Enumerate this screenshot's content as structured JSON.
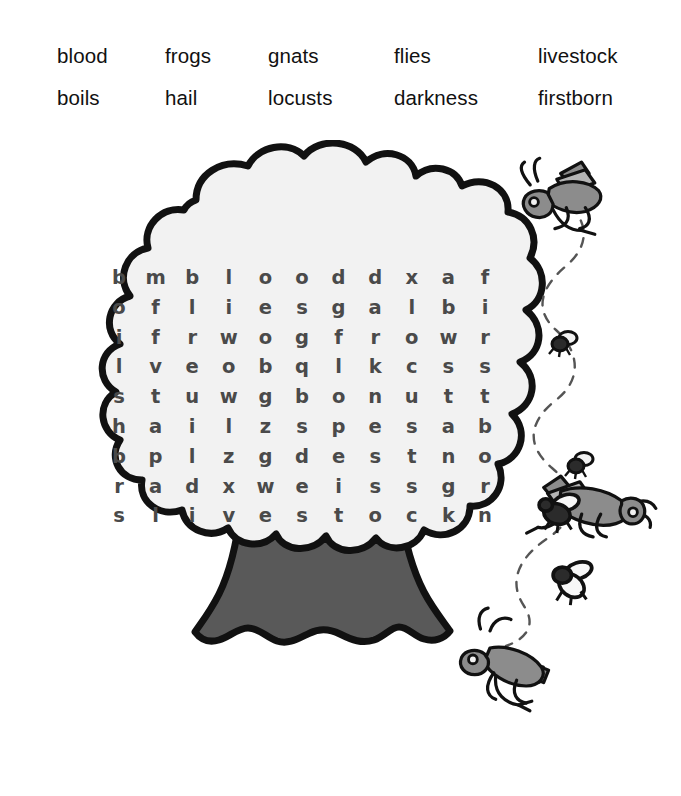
{
  "word_bank": {
    "rows": [
      [
        "blood",
        "frogs",
        "gnats",
        "flies",
        "livestock"
      ],
      [
        "boils",
        "hail",
        "locusts",
        "darkness",
        "firstborn"
      ]
    ]
  },
  "puzzle": {
    "grid": [
      [
        "b",
        "m",
        "b",
        "l",
        "o",
        "o",
        "d",
        "d",
        "x",
        "a",
        "f"
      ],
      [
        "o",
        "f",
        "l",
        "i",
        "e",
        "s",
        "g",
        "a",
        "l",
        "b",
        "i"
      ],
      [
        "i",
        "f",
        "r",
        "w",
        "o",
        "g",
        "f",
        "r",
        "o",
        "w",
        "r"
      ],
      [
        "l",
        "v",
        "e",
        "o",
        "b",
        "q",
        "l",
        "k",
        "c",
        "s",
        "s"
      ],
      [
        "s",
        "t",
        "u",
        "w",
        "g",
        "b",
        "o",
        "n",
        "u",
        "t",
        "t"
      ],
      [
        "h",
        "a",
        "i",
        "l",
        "z",
        "s",
        "p",
        "e",
        "s",
        "a",
        "b"
      ],
      [
        "b",
        "p",
        "l",
        "z",
        "g",
        "d",
        "e",
        "s",
        "t",
        "n",
        "o"
      ],
      [
        "r",
        "a",
        "d",
        "x",
        "w",
        "e",
        "i",
        "s",
        "s",
        "g",
        "r"
      ],
      [
        "s",
        "l",
        "i",
        "v",
        "e",
        "s",
        "t",
        "o",
        "c",
        "k",
        "n"
      ]
    ],
    "rows": 9,
    "columns": 11
  },
  "colors": {
    "outline": "#111111",
    "canopy_fill": "#f2f2f2",
    "trunk_fill": "#595959",
    "letter": "#4a4a4a",
    "word_text": "#111111",
    "insect_body": "#8c8c8c",
    "insect_light": "#b5b5b5",
    "background": "#ffffff"
  },
  "illustration": {
    "tree_label": "tree",
    "canopy_label": "tree-canopy",
    "trunk_label": "tree-trunk",
    "trail_label": "insect-flight-trail",
    "insects": [
      {
        "name": "grasshopper-top",
        "type": "grasshopper"
      },
      {
        "name": "gnat-upper",
        "type": "gnat"
      },
      {
        "name": "gnat-mid",
        "type": "gnat"
      },
      {
        "name": "grasshopper-middle",
        "type": "grasshopper"
      },
      {
        "name": "fly-upper",
        "type": "fly"
      },
      {
        "name": "fly-lower",
        "type": "fly"
      },
      {
        "name": "grasshopper-bottom",
        "type": "grasshopper"
      }
    ]
  }
}
